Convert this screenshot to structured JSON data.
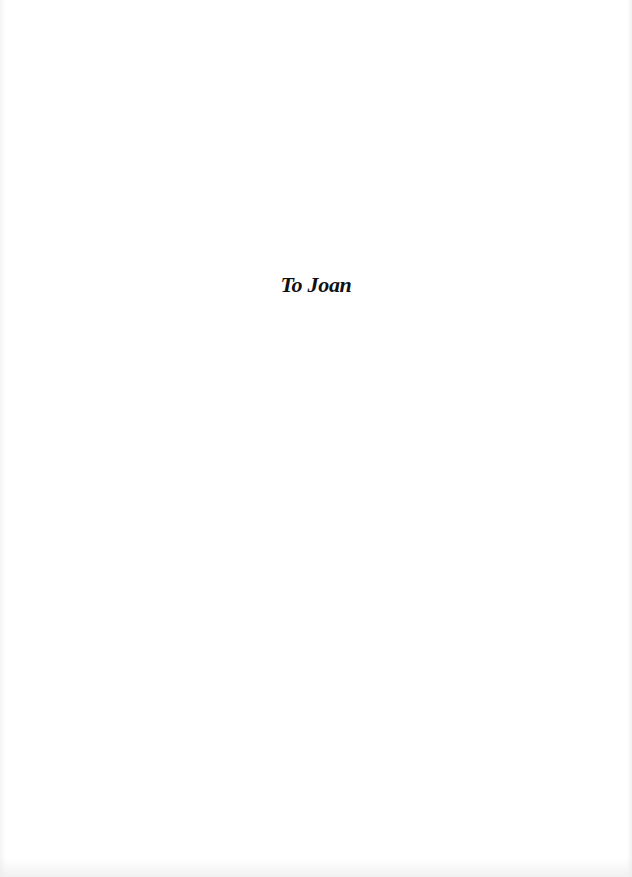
{
  "page": {
    "type": "dedication",
    "background_color": "#ffffff",
    "text_color": "#111111"
  },
  "dedication": {
    "text": "To Joan"
  }
}
